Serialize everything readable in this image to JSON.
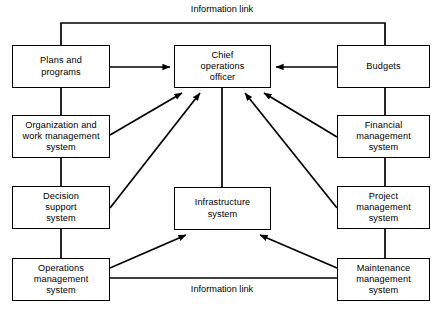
{
  "diagram": {
    "title": "Information link",
    "nodes": [
      {
        "id": "plans",
        "label": "Plans and\nprograms",
        "x": 12,
        "y": 45,
        "w": 98,
        "h": 43
      },
      {
        "id": "coo",
        "label": "Chief\noperations\nofficer",
        "x": 174,
        "y": 45,
        "w": 97,
        "h": 43
      },
      {
        "id": "budgets",
        "label": "Budgets",
        "x": 337,
        "y": 45,
        "w": 93,
        "h": 43
      },
      {
        "id": "organization",
        "label": "Organization and\nwork management\nsystem",
        "x": 12,
        "y": 115,
        "w": 98,
        "h": 43
      },
      {
        "id": "financial",
        "label": "Financial\nmanagement\nsystem",
        "x": 337,
        "y": 115,
        "w": 93,
        "h": 43
      },
      {
        "id": "decision",
        "label": "Decision\nsupport\nsystem",
        "x": 12,
        "y": 186,
        "w": 98,
        "h": 43
      },
      {
        "id": "infrastructure",
        "label": "Infrastructure\nsystem",
        "x": 174,
        "y": 187,
        "w": 97,
        "h": 43
      },
      {
        "id": "project",
        "label": "Project\nmanagement\nsystem",
        "x": 337,
        "y": 186,
        "w": 93,
        "h": 43
      },
      {
        "id": "operations",
        "label": "Operations\nmanagement\nsystem",
        "x": 12,
        "y": 258,
        "w": 98,
        "h": 43
      },
      {
        "id": "maintenance",
        "label": "Maintenance\nmanagement\nsystem",
        "x": 337,
        "y": 258,
        "w": 93,
        "h": 43
      }
    ],
    "labels": [
      {
        "id": "info-link-top",
        "text": "Information link",
        "x": 222,
        "y": 10
      },
      {
        "id": "info-link-bottom",
        "text": "Information link",
        "x": 222,
        "y": 291
      }
    ],
    "edges": [
      {
        "id": "plans-to-coo",
        "from": "plans",
        "to": "coo",
        "arrow": true
      },
      {
        "id": "budgets-to-coo",
        "from": "budgets",
        "to": "coo",
        "arrow": true
      },
      {
        "id": "organization-to-coo",
        "from": "organization",
        "to": "coo",
        "arrow": true
      },
      {
        "id": "decision-to-coo",
        "from": "decision",
        "to": "coo",
        "arrow": true
      },
      {
        "id": "financial-to-coo",
        "from": "financial",
        "to": "coo",
        "arrow": true
      },
      {
        "id": "project-to-coo",
        "from": "project",
        "to": "coo",
        "arrow": true
      },
      {
        "id": "coo-to-infrastructure",
        "from": "coo",
        "to": "infrastructure",
        "arrow": false
      },
      {
        "id": "operations-to-infrastructure",
        "from": "operations",
        "to": "infrastructure",
        "arrow": true
      },
      {
        "id": "maintenance-to-infrastructure",
        "from": "maintenance",
        "to": "infrastructure",
        "arrow": true
      },
      {
        "id": "left-column-spine",
        "from": "plans",
        "to": "operations",
        "arrow": false
      },
      {
        "id": "right-column-spine",
        "from": "budgets",
        "to": "maintenance",
        "arrow": false
      },
      {
        "id": "top-information-link",
        "from": "plans",
        "to": "budgets",
        "arrow": false
      },
      {
        "id": "bottom-information-link",
        "from": "operations",
        "to": "maintenance",
        "arrow": false
      }
    ],
    "colors": {
      "line": "#000000",
      "box_fill": "#ffffff",
      "text": "#000000"
    }
  }
}
